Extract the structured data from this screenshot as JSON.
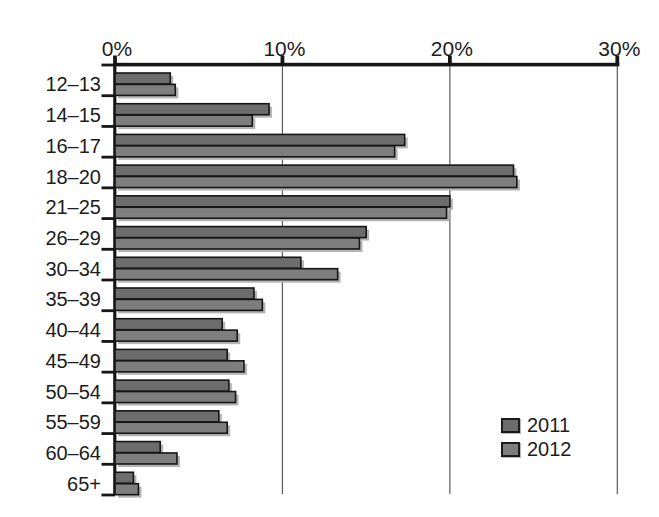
{
  "chart_data": {
    "type": "bar",
    "orientation": "horizontal",
    "title": "",
    "xlabel": "",
    "ylabel": "",
    "categories": [
      "12–13",
      "14–15",
      "16–17",
      "18–20",
      "21–25",
      "26–29",
      "30–34",
      "35–39",
      "40–44",
      "45–49",
      "50–54",
      "55–59",
      "60–64",
      "65+"
    ],
    "series": [
      {
        "name": "2011",
        "color": "#6d6d6d",
        "values": [
          3.3,
          9.2,
          17.3,
          23.8,
          20.0,
          15.0,
          11.1,
          8.3,
          6.4,
          6.7,
          6.8,
          6.2,
          2.7,
          1.1
        ]
      },
      {
        "name": "2012",
        "color": "#7e7e7e",
        "values": [
          3.6,
          8.2,
          16.7,
          24.0,
          19.8,
          14.6,
          13.3,
          8.8,
          7.3,
          7.7,
          7.2,
          6.7,
          3.7,
          1.4
        ]
      }
    ],
    "x_axis": {
      "min": 0,
      "max": 30,
      "ticks": [
        0,
        10,
        20,
        30
      ],
      "tick_labels": [
        "0%",
        "10%",
        "20%",
        "30%"
      ],
      "position": "top"
    },
    "grid": true,
    "legend_position": "inside-lower-right"
  },
  "colors": {
    "axis": "#161616",
    "gridline": "#5a5a5a",
    "text": "#1c1c1c",
    "bar_border": "#161616",
    "bar_shadow": "#b4b4b4",
    "background": "#ffffff"
  }
}
